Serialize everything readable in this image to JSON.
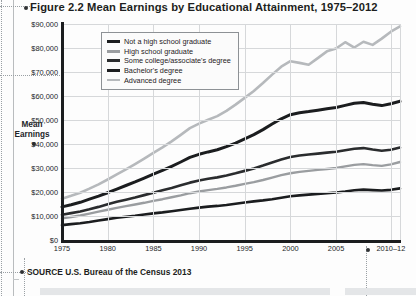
{
  "figure": {
    "title": "Figure 2.2  Mean Earnings by Educational Attainment, 1975–2012",
    "source": "SOURCE  U.S. Bureau of the Census 2013",
    "axis_caption_line1": "Mean",
    "axis_caption_line2": "Earnings"
  },
  "chart_data": {
    "type": "line",
    "title": "Figure 2.2  Mean Earnings by Educational Attainment, 1975–2012",
    "xlabel": "",
    "ylabel": "Mean Earnings",
    "ylim": [
      0,
      90000
    ],
    "xlim": [
      1975,
      2012
    ],
    "grid": true,
    "legend_position": "top-left",
    "ytick_labels": [
      "$90,000",
      "$80,000",
      "$70,000",
      "$60,000",
      "$50,000",
      "$40,000",
      "$30,000",
      "$20,000",
      "$10,000",
      "$0"
    ],
    "ytick_values": [
      90000,
      80000,
      70000,
      60000,
      50000,
      40000,
      30000,
      20000,
      10000,
      0
    ],
    "xtick_labels": [
      "1975",
      "1980",
      "1985",
      "1990",
      "1995",
      "2000",
      "2005",
      "2010–12"
    ],
    "xtick_values": [
      1975,
      1980,
      1985,
      1990,
      1995,
      2000,
      2005,
      2011
    ],
    "x": [
      1975,
      1976,
      1977,
      1978,
      1979,
      1980,
      1981,
      1982,
      1983,
      1984,
      1985,
      1986,
      1987,
      1988,
      1989,
      1990,
      1991,
      1992,
      1993,
      1994,
      1995,
      1996,
      1997,
      1998,
      1999,
      2000,
      2001,
      2002,
      2003,
      2004,
      2005,
      2006,
      2007,
      2008,
      2009,
      2010,
      2011,
      2012
    ],
    "series": [
      {
        "name": "Not a high school graduate",
        "color": "#1b1d1f",
        "width": 2.6,
        "values": [
          6200,
          6600,
          7000,
          7500,
          8100,
          8700,
          9300,
          9700,
          10100,
          10600,
          11100,
          11500,
          12000,
          12500,
          13000,
          13500,
          13900,
          14200,
          14600,
          15100,
          15600,
          16100,
          16500,
          17000,
          17600,
          18200,
          18600,
          18900,
          19200,
          19500,
          19800,
          20200,
          20700,
          21000,
          20800,
          20600,
          20900,
          21500
        ]
      },
      {
        "name": "High school graduate",
        "color": "#9a9da0",
        "width": 2.4,
        "values": [
          9000,
          9600,
          10200,
          11000,
          11800,
          12600,
          13400,
          14100,
          14800,
          15500,
          16300,
          17000,
          17800,
          18600,
          19500,
          20200,
          20800,
          21300,
          21900,
          22600,
          23400,
          24100,
          25000,
          26000,
          27000,
          27800,
          28400,
          28800,
          29200,
          29600,
          30000,
          30700,
          31300,
          31600,
          31200,
          30900,
          31500,
          32500
        ]
      },
      {
        "name": "Some college/associate's degree",
        "color": "#2a2c2e",
        "width": 2.6,
        "values": [
          10500,
          11200,
          11900,
          12800,
          13800,
          14900,
          15900,
          16800,
          17700,
          18700,
          19700,
          20700,
          21700,
          22800,
          23900,
          24800,
          25500,
          26100,
          26900,
          27800,
          28800,
          29800,
          31000,
          32300,
          33500,
          34600,
          35200,
          35600,
          36000,
          36400,
          36800,
          37400,
          38000,
          38300,
          37700,
          37200,
          37600,
          38500
        ]
      },
      {
        "name": "Bachelor's degree",
        "color": "#1b1d1f",
        "width": 3.0,
        "values": [
          13800,
          14700,
          15700,
          17000,
          18300,
          19700,
          21200,
          22700,
          24200,
          25800,
          27400,
          29000,
          30700,
          32500,
          34400,
          35700,
          36700,
          37600,
          38900,
          40400,
          42100,
          43900,
          46000,
          48300,
          50500,
          52200,
          53000,
          53500,
          54100,
          54700,
          55200,
          56100,
          57000,
          57300,
          56600,
          56000,
          56800,
          57800
        ]
      },
      {
        "name": "Advanced degree",
        "color": "#b6b9bc",
        "width": 2.6,
        "values": [
          17200,
          18400,
          19700,
          21400,
          23200,
          25200,
          27300,
          29400,
          31600,
          33900,
          36300,
          38600,
          41100,
          43800,
          46600,
          48500,
          50100,
          51600,
          53800,
          56400,
          59200,
          62100,
          65400,
          68900,
          72200,
          74500,
          73800,
          73000,
          75800,
          78600,
          79800,
          82400,
          80200,
          82600,
          81300,
          83900,
          86800,
          89000
        ]
      }
    ]
  },
  "legend": [
    {
      "label": "Not a high school graduate",
      "color": "#1b1d1f",
      "thickness": "3px"
    },
    {
      "label": "High school graduate",
      "color": "#9a9da0",
      "thickness": "2.4px"
    },
    {
      "label": "Some college/associate's degree",
      "color": "#2a2c2e",
      "thickness": "3px"
    },
    {
      "label": "Bachelor's degree",
      "color": "#1b1d1f",
      "thickness": "3.2px"
    },
    {
      "label": "Advanced degree",
      "color": "#b6b9bc",
      "thickness": "2.2px"
    }
  ],
  "colors": {
    "axis": "#1b1d1f",
    "grid": "#d6d8da",
    "page": "#ffffff",
    "guide": "#9aa0a4"
  }
}
